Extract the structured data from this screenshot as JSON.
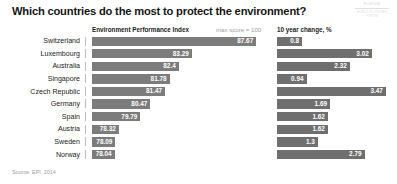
{
  "title": "Which countries do the most to protect the environment?",
  "logo": {
    "mark": "FORUM",
    "sub": "WORLD ECONOMIC FORUM"
  },
  "headers": {
    "epi": "Environment Performance Index",
    "max": "max score = 100",
    "change": "10 year change, %"
  },
  "source": "Source: EPI, 2014",
  "colors": {
    "bar": "#7c7c7c",
    "bar_dark": "#6f6f6f",
    "label": "#ffffff",
    "title": "#161616",
    "muted": "#a0a0a0"
  },
  "chart_data": {
    "type": "bar",
    "title": "Which countries do the most to protect the environment?",
    "xlabel": "",
    "ylabel": "",
    "orientation": "horizontal",
    "grid": false,
    "legend": "none",
    "note": "max score = 100",
    "source": "Source: EPI, 2014",
    "categories": [
      "Switzerland",
      "Luxembourg",
      "Australia",
      "Singapore",
      "Czech Republic",
      "Germany",
      "Spain",
      "Austria",
      "Sweden",
      "Norway"
    ],
    "series": [
      {
        "name": "Environment Performance Index",
        "unit": "score",
        "axis_note": "truncated axis, bars not zero-based",
        "values": [
          87.67,
          83.29,
          82.4,
          81.78,
          81.47,
          80.47,
          79.79,
          78.32,
          78.09,
          78.04
        ],
        "labels": [
          "87.67",
          "83.29",
          "82.4",
          "81.78",
          "81.47",
          "80.47",
          "79.79",
          "78.32",
          "78.09",
          "78.04"
        ],
        "xlim": [
          76.5,
          88.2
        ]
      },
      {
        "name": "10 year change, %",
        "unit": "%",
        "values": [
          0.8,
          3.02,
          2.32,
          0.94,
          3.47,
          1.69,
          1.62,
          1.62,
          1.3,
          2.79
        ],
        "labels": [
          "0.8",
          "3.02",
          "2.32",
          "0.94",
          "3.47",
          "1.69",
          "1.62",
          "1.62",
          "1.3",
          "2.79"
        ],
        "xlim": [
          0,
          3.6
        ]
      }
    ]
  }
}
